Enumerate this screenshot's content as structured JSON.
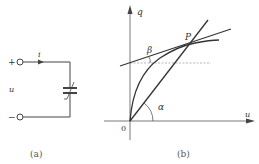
{
  "figure_a": {
    "caption": "(a)",
    "current_label": "i",
    "voltage_label": "u",
    "plus_sign": "+",
    "minus_sign": "−",
    "element": "nonlinear-capacitor"
  },
  "figure_b": {
    "caption": "(b)",
    "y_axis_label": "q",
    "x_axis_label": "u",
    "origin_label": "0",
    "point_label": "P",
    "angle_alpha": "α",
    "angle_beta": "β"
  },
  "colors": {
    "line": "#333333",
    "dashed": "#888888",
    "background": "#ffffff"
  }
}
